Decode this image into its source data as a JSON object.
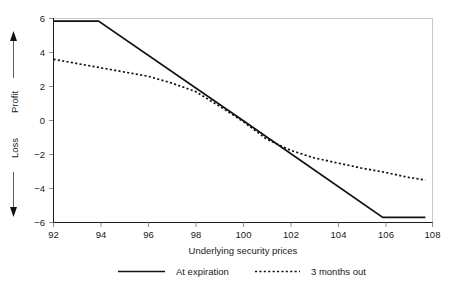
{
  "chart_data": {
    "type": "line",
    "title": "",
    "xlabel": "Underlying security prices",
    "ylabel": "Profit / Loss",
    "ylabel_upper": "Profit",
    "ylabel_lower": "Loss",
    "xlim": [
      92,
      108
    ],
    "ylim": [
      -6,
      6
    ],
    "xticks": [
      92,
      94,
      96,
      98,
      100,
      102,
      104,
      106,
      108
    ],
    "yticks": [
      6,
      4,
      2,
      0,
      -2,
      -4,
      -6
    ],
    "xtick_labels": [
      "92",
      "94",
      "96",
      "98",
      "100",
      "102",
      "104",
      "106",
      "108"
    ],
    "ytick_labels": [
      "6",
      "4",
      "2",
      "0",
      "−2",
      "−4",
      "−6"
    ],
    "grid": false,
    "legend_position": "bottom",
    "series": [
      {
        "name": "At expiration",
        "style": "solid",
        "color": "#111111",
        "x": [
          92.0,
          93.9,
          100.0,
          105.9,
          107.7
        ],
        "values": [
          5.85,
          5.85,
          0.0,
          -5.7,
          -5.7
        ]
      },
      {
        "name": "3 months out",
        "style": "dotted",
        "color": "#111111",
        "x": [
          92.0,
          93.0,
          94.0,
          95.0,
          96.0,
          97.0,
          98.0,
          99.0,
          100.0,
          101.0,
          102.0,
          103.0,
          104.0,
          105.0,
          106.0,
          107.0,
          107.7
        ],
        "values": [
          3.6,
          3.35,
          3.1,
          2.85,
          2.6,
          2.2,
          1.7,
          0.85,
          -0.05,
          -1.1,
          -1.75,
          -2.2,
          -2.5,
          -2.8,
          -3.05,
          -3.35,
          -3.5
        ]
      }
    ]
  },
  "legend": {
    "items": [
      {
        "label": "At expiration",
        "style": "solid"
      },
      {
        "label": "3 months out",
        "style": "dotted"
      }
    ]
  },
  "annotations": {
    "up_arrow": "profit-direction-arrow",
    "down_arrow": "loss-direction-arrow"
  }
}
